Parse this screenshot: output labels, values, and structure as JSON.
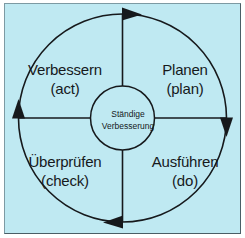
{
  "diagram": {
    "type": "pdca-cycle",
    "direction": "clockwise",
    "background_color": "#bfe9f2",
    "line_color": "#16191c",
    "text_color": "#16191c",
    "center": {
      "line1": "Ständige",
      "line2": "Verbesserung"
    },
    "quadrants": [
      {
        "id": "act",
        "position": "top-left",
        "title": "Verbessern",
        "subtitle": "(act)"
      },
      {
        "id": "plan",
        "position": "top-right",
        "title": "Planen",
        "subtitle": "(plan)"
      },
      {
        "id": "check",
        "position": "bottom-left",
        "title": "Überprüfen",
        "subtitle": "(check)"
      },
      {
        "id": "do",
        "position": "bottom-right",
        "title": "Ausführen",
        "subtitle": "(do)"
      }
    ],
    "arrows": [
      {
        "id": "arrow-top",
        "at": "top",
        "points": "right"
      },
      {
        "id": "arrow-right",
        "at": "right",
        "points": "down"
      },
      {
        "id": "arrow-bottom",
        "at": "bottom",
        "points": "left"
      },
      {
        "id": "arrow-left",
        "at": "left",
        "points": "up"
      }
    ]
  }
}
